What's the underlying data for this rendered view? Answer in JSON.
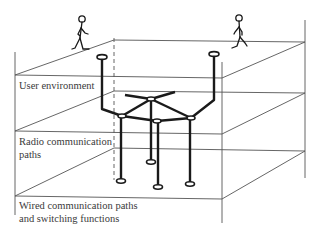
{
  "diagram": {
    "layers": [
      {
        "id": "user",
        "label": "User environment"
      },
      {
        "id": "radio",
        "label": "Radio communication\npaths"
      },
      {
        "id": "wired",
        "label": "Wired communication paths\nand switching functions"
      }
    ],
    "labels": {
      "user_line1": "User environment",
      "radio_line1": "Radio communication",
      "radio_line2": "paths",
      "wired_line1": "Wired communication paths",
      "wired_line2": "and switching functions"
    },
    "figures": [
      {
        "name": "walking-person-left",
        "position": "top-left plane"
      },
      {
        "name": "walking-person-right",
        "position": "top-right plane"
      }
    ],
    "network": {
      "antennas": 2,
      "hub_nodes": 4,
      "ground_terminals": 4
    },
    "colors": {
      "line": "#222222",
      "thin_line": "#555555",
      "text": "#3a3a3a"
    }
  }
}
